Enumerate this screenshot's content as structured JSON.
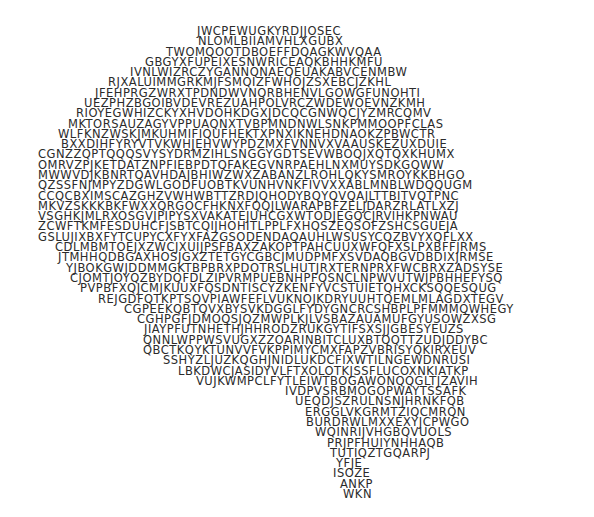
{
  "artwork": {
    "title": "Brain silhouette typographic artwork",
    "subject": "human brain lateral view",
    "style": "ascii-letter-mosaic",
    "background_color": "#ffffff",
    "text_color": "#2b2b2b",
    "glyph_set": "uppercase-latin",
    "canvas": {
      "width": 594,
      "height": 517
    },
    "row_count": 46,
    "rows": [
      {
        "y": 28,
        "x": 197,
        "size": 11.5,
        "text": "JWCPEWUGKYRDJJOSEC"
      },
      {
        "y": 41,
        "x": 198,
        "size": 11.5,
        "text": "NLOMLBIIAMVHLXGUBX"
      },
      {
        "y": 54,
        "x": 166,
        "size": 11.5,
        "text": "TWOMQOOTDBOEFFDQAGKWVQAA"
      },
      {
        "y": 67,
        "x": 145,
        "size": 11.5,
        "text": "GBGYXFUPEIXESNWRICEAQKBHHKMFU"
      },
      {
        "y": 80,
        "x": 130,
        "size": 11.5,
        "text": "IVNLWIZRCZYGANNQNAEQEUAKABVCENMBW"
      },
      {
        "y": 93,
        "x": 108,
        "size": 11.5,
        "text": "RJXALUIMMGRKMJFSMQIZFWHOJZSXEBCJZKHL"
      },
      {
        "y": 106,
        "x": 95,
        "size": 11.5,
        "text": "JFEHPRGZWRXTPDNDWVNQRBHENVLGOWGFUNOHTI"
      },
      {
        "y": 119,
        "x": 84,
        "size": 11.5,
        "text": "UEZPHZBGOIBVDEVREZUAHPOLVRCZWDEWOEVNZKMH"
      },
      {
        "y": 132,
        "x": 76,
        "size": 11.5,
        "text": "RIOYEGWHIZCKYXHVDOHKDGXJDCQCGNWQCJYZMRCQMV"
      },
      {
        "y": 145,
        "x": 68,
        "size": 11.5,
        "text": "MKTORSAUZAGYVPPUAQNXTVBPMNDNWLSNKPMMOOPFCLAS"
      },
      {
        "y": 158,
        "x": 58,
        "size": 11.5,
        "text": "WLFKNZWSKJMKUHMIFIQUFHEKTXPNXIKNEHDNAOKZPBWCTR"
      },
      {
        "y": 171,
        "x": 61,
        "size": 11.5,
        "text": "BXXDIHFYRYVTVKWHJEHVWYPDZMXFVNNVXVAAUSKEZUXDUIE"
      },
      {
        "y": 184,
        "x": 38,
        "size": 11.5,
        "text": "CGNZZQPTQQQSVYSYDRMZIHLSNGGYGDTSEVWBOQJXQTQXKHUMX"
      },
      {
        "y": 197,
        "x": 38,
        "size": 11.5,
        "text": "OMRVZPJKETDATZNPFIEBPDTQFAKEGVNRPAEHLNXMUYSDKGQWW"
      },
      {
        "y": 210,
        "x": 38,
        "size": 11.5,
        "text": "MWWVDJKBNRTQAVHDAJBHIWZWXZABANZLROHLQKYSMROYKKBHGO"
      },
      {
        "y": 223,
        "x": 38,
        "size": 11.5,
        "text": "QZSSFNJMPYZDGWLGODFUOBTKVUNHVNKFIVVXXABLMNBLWDQQUGM"
      },
      {
        "y": 236,
        "x": 38,
        "size": 11.5,
        "text": "CCQCBXIMSCAZGHZVWHWBTTZRDJQHODYBQYQVQAJLTTBITVQTPNC"
      },
      {
        "y": 249,
        "x": 38,
        "size": 11.5,
        "text": "MKVZSKKKBKFWXXQRGOCFHKNXFQQJLWARAPBFZELJDARZRLATLXZJ"
      },
      {
        "y": 262,
        "x": 38,
        "size": 11.5,
        "text": "VSGHKJMLRXOSGVJPIPYSXVAKATEJUHCGXWTODJEGQCJRVIHKPNWAU"
      },
      {
        "y": 275,
        "x": 38,
        "size": 11.5,
        "text": "ZCWFTKMFESDUHCFJSBTCQIJHOHITLPPLFXHQSZEQSOFZSHCSGUEJA"
      },
      {
        "y": 288,
        "x": 38,
        "size": 11.5,
        "text": "GSLUJIXBXFYTCUPYCXFYXFAZGSODENDAQAUHLWSUSYCQZBVYXQFLXX"
      },
      {
        "y": 301,
        "x": 55,
        "size": 11.5,
        "text": "CDLMBMTOEJXZWCJXUIJPSFBAXZAKOPTPAHCUUXWFQFXSLPXBFFJRMS"
      },
      {
        "y": 314,
        "x": 58,
        "size": 11.5,
        "text": "JTMHHQDBGAXHOSJGXZTETGYCGBCJMUDPMFXSVDAQBGVDBDIXJRMSE"
      },
      {
        "y": 327,
        "x": 66,
        "size": 11.5,
        "text": "YJBOKGWJDDMMGKTBPBRXPDOTRSLHUTJRXTERNPRXFWCBRXZADSYSE"
      },
      {
        "y": 340,
        "x": 70,
        "size": 11.5,
        "text": "CJOMTJOYQZBYDQFDLZIPVRMPUEBNHPFQSNCLNPWVUTWJPBHHEFYSQ"
      },
      {
        "y": 353,
        "x": 80,
        "size": 11.5,
        "text": "PVPBFXQJCMJKUUXFQSDNTISCYZKENFYVCSTUIETQHXCKSQQESQUG"
      },
      {
        "y": 366,
        "x": 98,
        "size": 11.5,
        "text": "REJGDFQTKPTSQVPIAWFEFLVUKNOJKDRYUUHTQEMLMLAGDXTEGV"
      },
      {
        "y": 379,
        "x": 124,
        "size": 11.5,
        "text": "CGPEEKQBTQVXBYSVKDGGLFYDYGNCRCSHBPLPFMMMQWHEGY"
      },
      {
        "y": 392,
        "x": 137,
        "size": 11.5,
        "text": "CGHPGFJDMOQSJQZMWPLKJLVSBAZAUAMUFGYUSOWZXSG"
      },
      {
        "y": 405,
        "x": 144,
        "size": 11.5,
        "text": "JIAYPFUTNHETHJHHRODZRUKGYTIFSXSJJGBESYEUZS"
      },
      {
        "y": 418,
        "x": 143,
        "size": 11.5,
        "text": "QNNLWPPWSVUGXZZOARINBITCLUXBTQQTTZUDJDDYBC"
      },
      {
        "y": 431,
        "x": 143,
        "size": 11.5,
        "text": "QBCTKQYKTUNVVFVKPPIMYCMXFAPZVBRISYQKIRXEUV"
      },
      {
        "y": 444,
        "x": 163,
        "size": 11.5,
        "text": "SSHYZLJUZKQGHJNIDLUKDCFIXWTILNGEWDNRUSI"
      },
      {
        "y": 457,
        "x": 178,
        "size": 11.5,
        "text": "LBKDWCJASIDYVLFTXOLOTKJSSFLUCOXNKIATKP"
      },
      {
        "y": 470,
        "x": 196,
        "size": 11.5,
        "text": "VUJKWMPCLFYTLEIWTBOGAWONQQGLTJZAVIH"
      },
      {
        "y": 483,
        "x": 285,
        "size": 11.5,
        "text": "IVDPVSRBMOGOPWAYTSSAFK"
      },
      {
        "y": 496,
        "x": 295,
        "size": 11.5,
        "text": "UEQDJSZRULNSNJHRNKFQB"
      },
      {
        "y": 509,
        "x": 305,
        "size": 11.5,
        "text": "ERGGLVKGRMTZIQCMRQN"
      },
      {
        "y": 522,
        "x": 306,
        "size": 11.5,
        "text": "BURDRWLMXXEXYJCPWGO"
      },
      {
        "y": 535,
        "x": 315,
        "size": 11.5,
        "text": "WQINRIJVHGBQVUOLS"
      },
      {
        "y": 548,
        "x": 327,
        "size": 11.5,
        "text": "PRJPFHUIYNHHAQB"
      },
      {
        "y": 561,
        "x": 330,
        "size": 11.5,
        "text": "TUTIQZTGQARPJ"
      },
      {
        "y": 574,
        "x": 336,
        "size": 11.5,
        "text": "YFJE"
      },
      {
        "y": 587,
        "x": 333,
        "size": 11.5,
        "text": "ISOZE"
      },
      {
        "y": 600,
        "x": 340,
        "size": 11.5,
        "text": "ANKP"
      },
      {
        "y": 613,
        "x": 343,
        "size": 11.5,
        "text": "WKN"
      }
    ]
  }
}
